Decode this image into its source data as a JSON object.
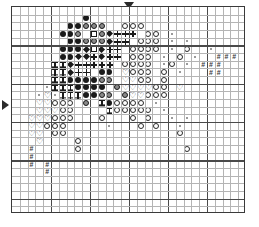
{
  "chart": {
    "kind": "cross-stitch-grid",
    "columns": 30,
    "rows": 27,
    "cell_px": 7.8,
    "heavy_line_every": 5,
    "grid_color": "#b4b4b4",
    "heavy_grid_color": "#4a4a4a",
    "border_color": "#3a3a3a"
  },
  "markers": {
    "top": {
      "name": "center-marker-top",
      "glyph": "▼",
      "column": 15
    },
    "left": {
      "name": "center-marker-left",
      "glyph": "◀",
      "row": 12
    }
  },
  "legend": {
    "symbols": [
      {
        "key": "F",
        "name": "filled-circle",
        "glyph": "●",
        "color": "#1a1a1a"
      },
      {
        "key": "H",
        "name": "half-filled-circle",
        "glyph": "◕",
        "color": "#8a8a8a"
      },
      {
        "key": "O",
        "name": "open-circle",
        "glyph": "○",
        "color": "#2a2a2a"
      },
      {
        "key": "Q",
        "name": "open-square",
        "glyph": "□",
        "color": "#1a1a1a"
      },
      {
        "key": "D",
        "name": "filled-diamond",
        "glyph": "◆",
        "color": "#1a1a1a"
      },
      {
        "key": "P",
        "name": "plus-sign",
        "glyph": "+",
        "color": "#1a1a1a"
      },
      {
        "key": "I",
        "name": "i-beam",
        "glyph": "I",
        "color": "#1a1a1a"
      },
      {
        "key": "V",
        "name": "heart",
        "glyph": "♡",
        "color": "#2a2a2a"
      },
      {
        "key": "N",
        "name": "hash",
        "glyph": "#",
        "color": "#3a3a3a"
      },
      {
        "key": "T",
        "name": "tiny-dot",
        "glyph": "▪",
        "color": "#9a9a9a"
      }
    ]
  },
  "chart_data": {
    "type": "heatmap",
    "xlabel": "",
    "ylabel": "",
    "grid": true,
    "legend_position": "none",
    "columns": 30,
    "rows": 27,
    "symbol_key": {
      "F": "filled-circle",
      "H": "half-filled-circle",
      "O": "open-circle",
      "Q": "open-square",
      "D": "filled-diamond",
      "P": "plus-sign",
      "I": "i-beam",
      "V": "heart",
      "N": "hash",
      "T": "tiny-dot",
      ".": "empty"
    },
    "cells": [
      "..............................",
      ".........F....................",
      ".......FFHHH..OOO.............",
      "......FFH.QHDPPP.OO.T.........",
      ".......FFHHHDPP.OOO.T.T.......",
      "......FFFDQDPP.OOOO.T.O..T....",
      "......FFDDPDPP.OOO.T.O.T..NNN.",
      ".....IIDPPPPP.OOOO.TO.T.NNN...",
      ".....IIDPP.FF.VOOO.O.T...NN...",
      ".....IIFFFFHH.VVOO.O..........",
      "....TIIIFFFF.HVVVVOO.V........",
      "...TVTIIIFFHH.HVVOOO..........",
      "...VVOOO.H.IFOOOO.T...........",
      "...VVVOO....IOOOOO.T..........",
      "..VVVOOO...O...O.O..T.T.......",
      "..VVOOO.....T...O.O..T........",
      "..VV.OO..............O........",
      "...V....O.....................",
      "..N.....O.............O.......",
      "..N...........................",
      "..N.N.........................",
      "....N.........................",
      "..............................",
      "..............................",
      "..............................",
      "..............................",
      ".............................."
    ]
  }
}
